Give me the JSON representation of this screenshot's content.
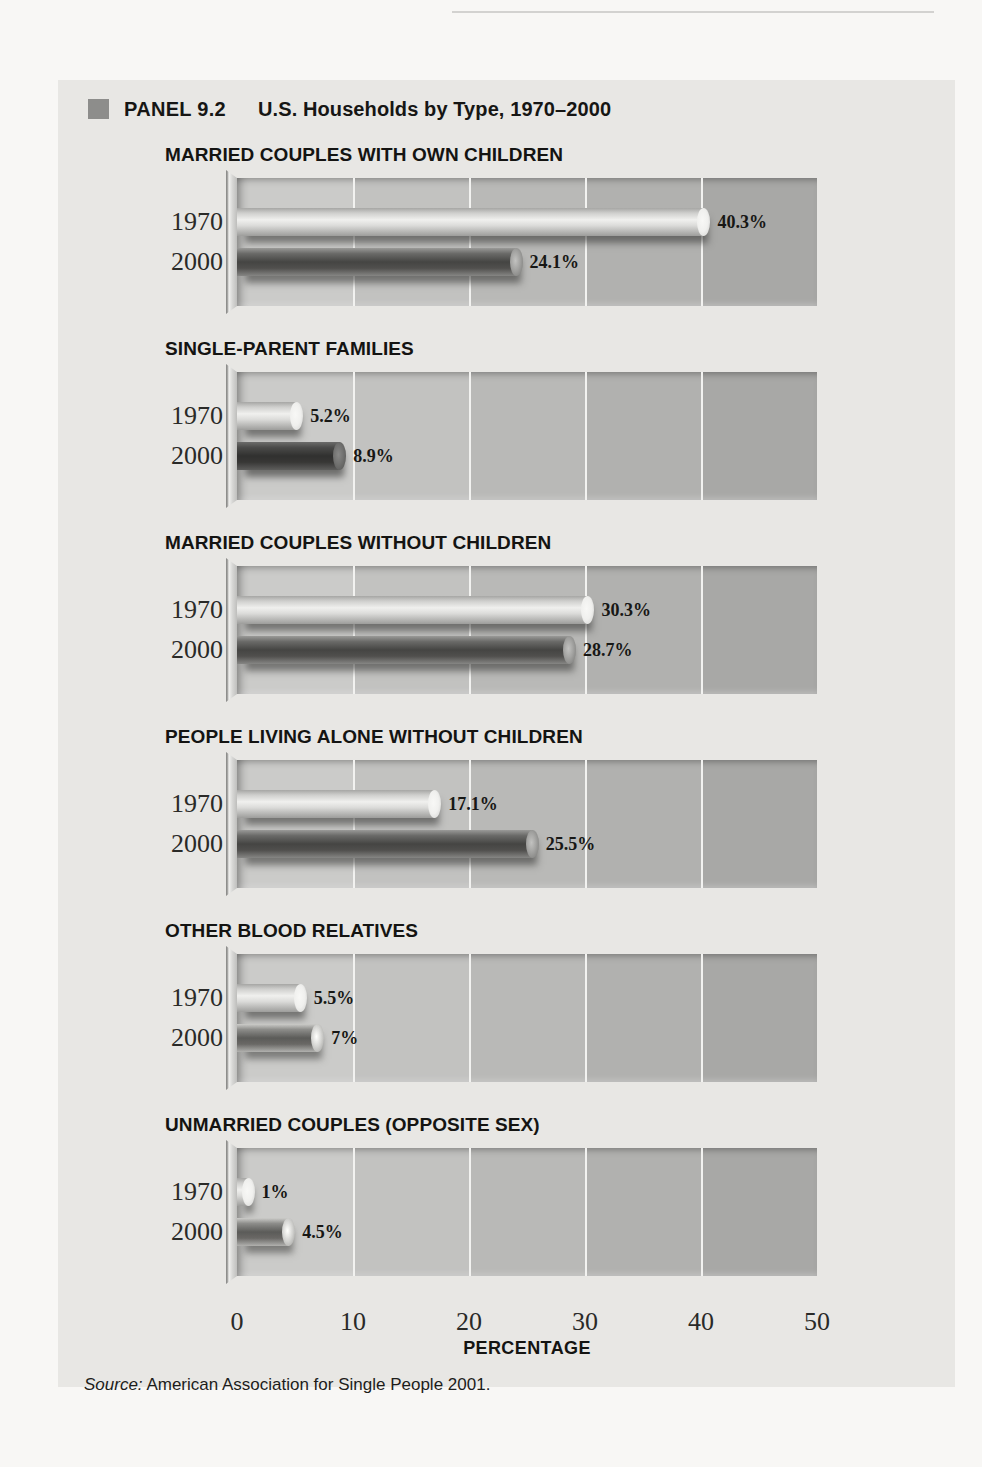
{
  "header": {
    "panel_label": "PANEL 9.2",
    "title": "U.S. Households by Type, 1970–2000"
  },
  "chart_data": {
    "type": "bar",
    "orientation": "horizontal",
    "unit": "percent",
    "xlabel": "PERCENTAGE",
    "xlim": [
      0,
      50
    ],
    "xticks": [
      0,
      10,
      20,
      30,
      40,
      50
    ],
    "grid": true,
    "series_years": [
      "1970",
      "2000"
    ],
    "groups": [
      {
        "title": "MARRIED COUPLES WITH OWN CHILDREN",
        "rows": [
          {
            "year": "1970",
            "value": 40.3,
            "label": "40.3%",
            "shade": "light"
          },
          {
            "year": "2000",
            "value": 24.1,
            "label": "24.1%",
            "shade": "dark"
          }
        ]
      },
      {
        "title": "SINGLE-PARENT FAMILIES",
        "rows": [
          {
            "year": "1970",
            "value": 5.2,
            "label": "5.2%",
            "shade": "light"
          },
          {
            "year": "2000",
            "value": 8.9,
            "label": "8.9%",
            "shade": "darkest"
          }
        ]
      },
      {
        "title": "MARRIED COUPLES WITHOUT CHILDREN",
        "rows": [
          {
            "year": "1970",
            "value": 30.3,
            "label": "30.3%",
            "shade": "light"
          },
          {
            "year": "2000",
            "value": 28.7,
            "label": "28.7%",
            "shade": "dark"
          }
        ]
      },
      {
        "title": "PEOPLE LIVING ALONE WITHOUT CHILDREN",
        "rows": [
          {
            "year": "1970",
            "value": 17.1,
            "label": "17.1%",
            "shade": "light"
          },
          {
            "year": "2000",
            "value": 25.5,
            "label": "25.5%",
            "shade": "dark"
          }
        ]
      },
      {
        "title": "OTHER BLOOD RELATIVES",
        "rows": [
          {
            "year": "1970",
            "value": 5.5,
            "label": "5.5%",
            "shade": "light"
          },
          {
            "year": "2000",
            "value": 7,
            "label": "7%",
            "shade": "medium"
          }
        ]
      },
      {
        "title": "UNMARRIED COUPLES (OPPOSITE SEX)",
        "rows": [
          {
            "year": "1970",
            "value": 1,
            "label": "1%",
            "shade": "light"
          },
          {
            "year": "2000",
            "value": 4.5,
            "label": "4.5%",
            "shade": "medium"
          }
        ]
      }
    ]
  },
  "source": {
    "prefix": "Source:",
    "text": " American Association for Single People 2001."
  },
  "colors": {
    "page_background": "#f8f7f5",
    "panel_background": "#e8e7e4",
    "bullet": "#8d8d8b",
    "bar_1970": "#eeeeec",
    "bar_2000": "#4a4a48",
    "plot_bands": [
      "#cbcbc9",
      "#c2c2c0",
      "#b9b9b7",
      "#b1b1af",
      "#a8a8a6"
    ],
    "gridline": "#f2f2f0",
    "text": "#161614"
  }
}
